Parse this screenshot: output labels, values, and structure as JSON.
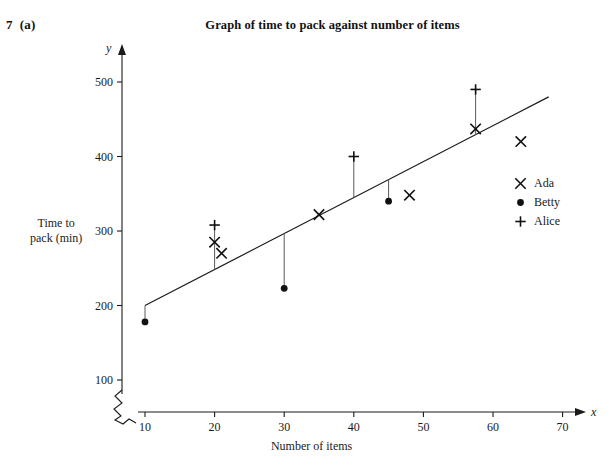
{
  "question": {
    "number": "7",
    "part": "(a)"
  },
  "chart_data": {
    "type": "scatter",
    "title": "Graph of time to pack against number of items",
    "xlabel": "Number of items",
    "ylabel": "Time to pack (min)",
    "ylabel_line1": "Time to",
    "ylabel_line2": "pack (min)",
    "x_axis_symbol": "x",
    "y_axis_symbol": "y",
    "xlim": [
      7,
      71
    ],
    "ylim": [
      75,
      545
    ],
    "xticks": [
      10,
      20,
      30,
      40,
      50,
      60,
      70
    ],
    "yticks": [
      100,
      200,
      300,
      400,
      500
    ],
    "grid": false,
    "axis_break": true,
    "legend_position": "right",
    "series": [
      {
        "name": "Ada",
        "marker": "x",
        "points": [
          {
            "x": 20,
            "y": 285
          },
          {
            "x": 21,
            "y": 270
          },
          {
            "x": 35,
            "y": 322
          },
          {
            "x": 48,
            "y": 348
          },
          {
            "x": 57.5,
            "y": 437
          },
          {
            "x": 64,
            "y": 420
          }
        ]
      },
      {
        "name": "Betty",
        "marker": "dot",
        "points": [
          {
            "x": 10,
            "y": 178
          },
          {
            "x": 30,
            "y": 223
          },
          {
            "x": 45,
            "y": 340
          }
        ]
      },
      {
        "name": "Alice",
        "marker": "plus",
        "points": [
          {
            "x": 20,
            "y": 308
          },
          {
            "x": 40,
            "y": 400
          },
          {
            "x": 57.5,
            "y": 490
          }
        ]
      }
    ],
    "trend_line": {
      "x1": 10,
      "y1": 200,
      "x2": 68,
      "y2": 480
    },
    "residual_lines": [
      {
        "x": 10,
        "y_point": 178,
        "y_line": 200
      },
      {
        "x": 20,
        "y_point": 308,
        "y_line": 248
      },
      {
        "x": 30,
        "y_point": 223,
        "y_line": 297
      },
      {
        "x": 40,
        "y_point": 400,
        "y_line": 345
      },
      {
        "x": 45,
        "y_point": 340,
        "y_line": 369
      },
      {
        "x": 57.5,
        "y_point": 490,
        "y_line": 429
      }
    ]
  },
  "legend": {
    "items": [
      {
        "label": "Ada",
        "marker": "x"
      },
      {
        "label": "Betty",
        "marker": "dot"
      },
      {
        "label": "Alice",
        "marker": "plus"
      }
    ]
  }
}
